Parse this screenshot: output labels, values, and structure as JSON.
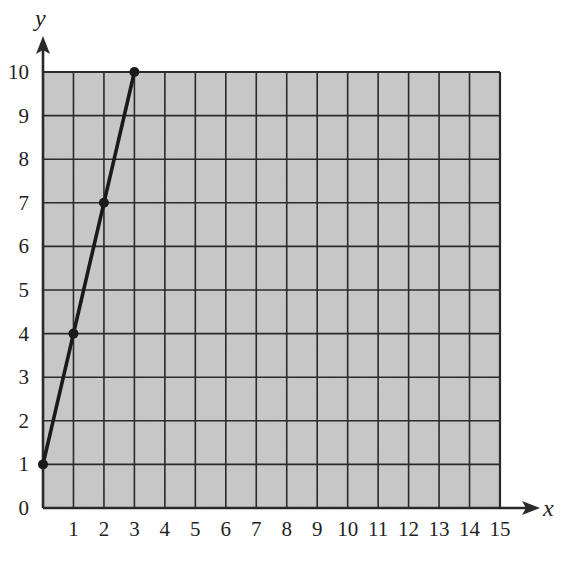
{
  "chart_data": {
    "type": "line",
    "title": "",
    "xlabel": "x",
    "ylabel": "y",
    "xlim": [
      0,
      15
    ],
    "ylim": [
      0,
      10
    ],
    "grid": true,
    "x_ticks": [
      "1",
      "2",
      "3",
      "4",
      "5",
      "6",
      "7",
      "8",
      "9",
      "10",
      "11",
      "12",
      "13",
      "14",
      "15"
    ],
    "y_ticks": [
      "0",
      "1",
      "2",
      "3",
      "4",
      "5",
      "6",
      "7",
      "8",
      "9",
      "10"
    ],
    "series": [
      {
        "name": "line",
        "points": [
          {
            "x": 0,
            "y": 1
          },
          {
            "x": 1,
            "y": 4
          },
          {
            "x": 2,
            "y": 7
          },
          {
            "x": 3,
            "y": 10
          }
        ]
      }
    ]
  },
  "colors": {
    "grid_fill": "#c8c8c8",
    "grid_line": "#2a2a2a",
    "line": "#1a1a1a"
  }
}
